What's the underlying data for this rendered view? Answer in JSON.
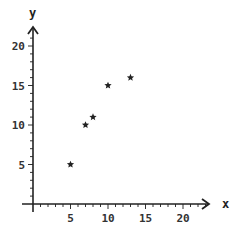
{
  "chart_data": {
    "type": "scatter",
    "title": "",
    "xlabel": "x",
    "ylabel": "y",
    "xlim": [
      0,
      22
    ],
    "ylim": [
      0,
      22
    ],
    "xticks": [
      5,
      10,
      15,
      20
    ],
    "yticks": [
      5,
      10,
      15,
      20
    ],
    "grid": false,
    "marker": "star",
    "marker_color": "#222222",
    "points": [
      {
        "x": 5,
        "y": 5
      },
      {
        "x": 7,
        "y": 10
      },
      {
        "x": 8,
        "y": 11
      },
      {
        "x": 10,
        "y": 15
      },
      {
        "x": 13,
        "y": 16
      }
    ]
  },
  "axes": {
    "x_label": "x",
    "y_label": "y",
    "x_tick_labels": [
      "5",
      "10",
      "15",
      "20"
    ],
    "y_tick_labels": [
      "5",
      "10",
      "15",
      "20"
    ]
  }
}
